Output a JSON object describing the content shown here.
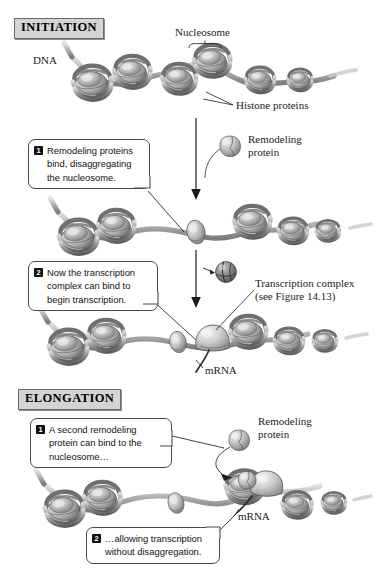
{
  "figure": {
    "sections": [
      {
        "id": "initiation",
        "title": "INITIATION"
      },
      {
        "id": "elongation",
        "title": "ELONGATION"
      }
    ],
    "labels": {
      "dna": "DNA",
      "nucleosome": "Nucleosome",
      "histone_proteins": "Histone proteins",
      "remodeling_protein_1": "Remodeling\nprotein",
      "remodeling_protein_2": "Remodeling\nprotein",
      "transcription_complex": "Transcription complex\n(see Figure 14.13)",
      "mrna_initiation": "mRNA",
      "mrna_elongation": "mRNA"
    },
    "callouts": [
      {
        "id": "initiation-step-1",
        "number": "1",
        "text": "Remodeling proteins\nbind, disaggregating\nthe nucleosome."
      },
      {
        "id": "initiation-step-2",
        "number": "2",
        "text": "Now the transcription\ncomplex can bind to\nbegin transcription."
      },
      {
        "id": "elongation-step-1",
        "number": "1",
        "text": "A second remodeling\nprotein can bind to the\nnucleosome…"
      },
      {
        "id": "elongation-step-2",
        "number": "2",
        "text": "…allowing transcription\nwithout disaggregation."
      }
    ],
    "colors": {
      "header_fill": "#d4d4d4",
      "header_border": "#6a6a6a",
      "callout_border": "#4a4a4a",
      "badge_fill": "#111111",
      "dna_strand": "#8d8d8d",
      "nucleosome_body": "#b4b4b4",
      "nucleosome_shadow": "#5d5d5d",
      "protein_fill": "#c2c2c2",
      "ink": "#1a1a1a"
    }
  }
}
